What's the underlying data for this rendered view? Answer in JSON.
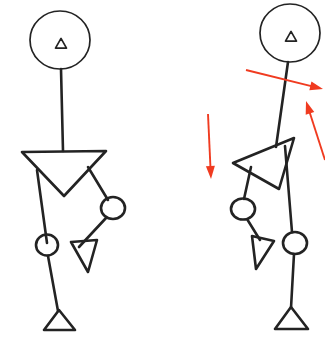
{
  "scene": {
    "title": "Stick Figure Pose Comparison",
    "width": 325,
    "height": 338,
    "background_color": "#ffffff",
    "stroke_color": "#232323",
    "arrow_color": "#f03b20",
    "stroke_width": 2.6,
    "thin_stroke_width": 1.7,
    "arrow_stroke_width": 1.9
  },
  "figures": [
    {
      "id": "figure-left",
      "label": "Reference pose stick figure",
      "has_arrows": false,
      "head": {
        "cx": 60,
        "cy": 40,
        "rx": 30,
        "ry": 29
      },
      "face_marker": {
        "type": "triangle",
        "cx": 61,
        "cy": 44,
        "size": 11
      },
      "neck": {
        "x1": 61,
        "y1": 69,
        "x2": 63,
        "y2": 151
      },
      "torso": {
        "type": "inverted-triangle",
        "points": "22,152 106,151 64,196"
      },
      "left_leg": {
        "thigh": "37,170 47,243",
        "knee": {
          "cx": 47,
          "cy": 245,
          "rx": 11,
          "ry": 10.5
        },
        "shank": "48,256 58,311",
        "foot": {
          "type": "triangle",
          "points": "44,330 59,310 75,330"
        }
      },
      "right_leg": {
        "thigh": "88,167 108,200",
        "knee": {
          "cx": 113,
          "cy": 208,
          "rx": 12,
          "ry": 11
        },
        "shank": "106,218 79,247",
        "foot": {
          "type": "triangle",
          "points": "71,242 97,240 88,272"
        }
      }
    },
    {
      "id": "figure-right",
      "label": "Corrected pose stick figure with motion arrows",
      "has_arrows": true,
      "head": {
        "cx": 290,
        "cy": 33,
        "rx": 30,
        "ry": 29
      },
      "face_marker": {
        "type": "triangle",
        "cx": 291,
        "cy": 37,
        "size": 11
      },
      "neck": {
        "x1": 288,
        "y1": 62,
        "x2": 276,
        "y2": 147
      },
      "torso": {
        "type": "inverted-triangle",
        "points": "233,163 294,138 279,189"
      },
      "left_leg": {
        "thigh": "251,167 244,199",
        "knee": {
          "cx": 243,
          "cy": 209,
          "rx": 12,
          "ry": 10.5
        },
        "shank": "247,219 260,240",
        "foot": {
          "type": "triangle",
          "points": "252,236 274,241 256,269"
        }
      },
      "right_leg": {
        "thigh": "285,146 292,232",
        "knee": {
          "cx": 295,
          "cy": 243,
          "rx": 12,
          "ry": 11
        },
        "shank": "294,254 291,308",
        "foot": {
          "type": "triangle",
          "points": "275,329 291,307 308,329"
        }
      }
    }
  ],
  "arrows": [
    {
      "id": "arrow-torso-right",
      "name": "arrow-push-right",
      "direction": "right",
      "from": {
        "x": 246,
        "y": 70
      },
      "to": {
        "x": 323,
        "y": 89
      },
      "head_angle_deg": 14
    },
    {
      "id": "arrow-left-down",
      "name": "arrow-drop-down",
      "direction": "down",
      "from": {
        "x": 208,
        "y": 114
      },
      "to": {
        "x": 211,
        "y": 179
      },
      "head_angle_deg": 93
    },
    {
      "id": "arrow-right-up",
      "name": "arrow-lift-up",
      "direction": "up-left",
      "from": {
        "x": 325,
        "y": 160
      },
      "to": {
        "x": 306,
        "y": 101
      },
      "head_angle_deg": -107
    }
  ]
}
